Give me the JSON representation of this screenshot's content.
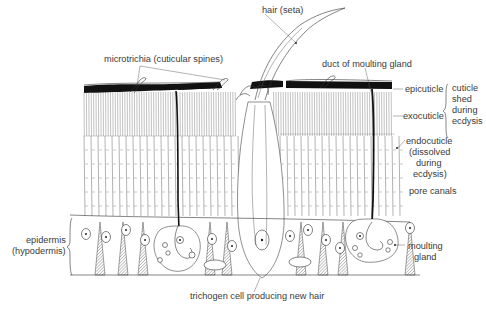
{
  "diagram": {
    "labels": {
      "hair": "hair (seta)",
      "microtrichia": "microtrichia (cuticular spines)",
      "duct": "duct of moulting gland",
      "epicuticle": "epicuticle",
      "exocuticle": "exocuticle",
      "cuticle_shed_1": "cuticle",
      "cuticle_shed_2": "shed",
      "cuticle_shed_3": "during",
      "cuticle_shed_4": "ecdysis",
      "endocuticle_1": "endocuticle",
      "endocuticle_2": "(dissolved",
      "endocuticle_3": "during",
      "endocuticle_4": "ecdysis)",
      "pore_canals": "pore canals",
      "epidermis_1": "epidermis",
      "epidermis_2": "(hypodermis)",
      "moulting_gland_1": "moulting",
      "moulting_gland_2": "gland",
      "trichogen": "trichogen cell producing new hair"
    },
    "colors": {
      "ink": "#222222",
      "label": "#3a3a3a",
      "background": "#ffffff"
    }
  }
}
